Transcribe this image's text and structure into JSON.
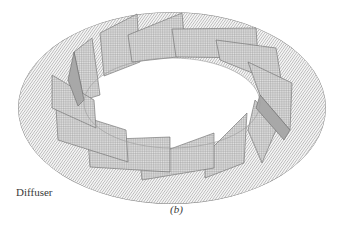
{
  "figure": {
    "component_label": "Diffuser",
    "subfigure_label": "(b)",
    "vane_count": 16,
    "colors": {
      "mesh_line": "#6e6e6e",
      "vane_face_light": "#d8d8d8",
      "vane_face_dark": "#9a9a9a",
      "background": "#ffffff"
    }
  }
}
